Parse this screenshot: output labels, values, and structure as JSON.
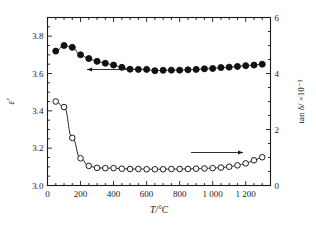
{
  "chart_data": {
    "type": "line",
    "title": "",
    "xlabel": "T/°C",
    "ylabel_left": "ε'",
    "ylabel_right": "tan δ/ ×10⁻³",
    "xlim": [
      0,
      1350
    ],
    "ylim_left": [
      3.0,
      3.9
    ],
    "ylim_right": [
      0,
      6
    ],
    "xticks": [
      0,
      200,
      400,
      600,
      800,
      1000,
      1200
    ],
    "xticklabels": [
      "0",
      "200",
      "400",
      "600",
      "800",
      "1 000",
      "1 200"
    ],
    "yticks_left": [
      3.0,
      3.2,
      3.4,
      3.6,
      3.8
    ],
    "yticklabels_left": [
      "3.0",
      "3.2",
      "3.4",
      "3.6",
      "3.8"
    ],
    "yticks_right": [
      0,
      2,
      4,
      6
    ],
    "yticklabels_right": [
      "0",
      "2",
      "4",
      "6"
    ],
    "xminor_step": 50,
    "yminor_left_step": 0.05,
    "yminor_right_step": 0.5,
    "grid": false,
    "legend": "none",
    "annotations": [
      {
        "name": "left-arrow",
        "text": "",
        "direction": "left",
        "points_to": "permittivity-series"
      },
      {
        "name": "right-arrow",
        "text": "",
        "direction": "right",
        "points_to": "loss-tangent-series"
      }
    ],
    "series": [
      {
        "name": "permittivity-series",
        "label": "ε'",
        "marker": "filled-circle",
        "axis": "left",
        "color": "#111111",
        "x": [
          50,
          100,
          150,
          200,
          250,
          300,
          350,
          400,
          450,
          500,
          550,
          600,
          650,
          700,
          750,
          800,
          850,
          900,
          950,
          1000,
          1050,
          1100,
          1150,
          1200,
          1250,
          1300
        ],
        "y": [
          3.72,
          3.75,
          3.74,
          3.7,
          3.68,
          3.665,
          3.655,
          3.645,
          3.633,
          3.623,
          3.622,
          3.622,
          3.615,
          3.617,
          3.618,
          3.618,
          3.62,
          3.622,
          3.625,
          3.627,
          3.632,
          3.634,
          3.638,
          3.642,
          3.645,
          3.65
        ]
      },
      {
        "name": "loss-tangent-series",
        "label": "tan δ",
        "marker": "open-circle",
        "axis": "right",
        "color": "#111111",
        "x": [
          50,
          100,
          150,
          200,
          250,
          300,
          350,
          400,
          450,
          500,
          550,
          600,
          650,
          700,
          750,
          800,
          850,
          900,
          950,
          1000,
          1050,
          1100,
          1150,
          1200,
          1250,
          1300
        ],
        "y_left_equiv": [
          3.45,
          3.42,
          3.255,
          3.145,
          3.105,
          3.095,
          3.093,
          3.093,
          3.09,
          3.088,
          3.088,
          3.087,
          3.087,
          3.087,
          3.088,
          3.088,
          3.089,
          3.09,
          3.091,
          3.093,
          3.096,
          3.1,
          3.108,
          3.118,
          3.135,
          3.152
        ],
        "y": [
          3.0,
          2.8,
          1.7,
          0.97,
          0.7,
          0.63,
          0.62,
          0.62,
          0.6,
          0.59,
          0.59,
          0.58,
          0.58,
          0.58,
          0.59,
          0.59,
          0.59,
          0.6,
          0.61,
          0.62,
          0.64,
          0.67,
          0.72,
          0.79,
          0.9,
          1.01
        ]
      }
    ]
  },
  "axes": {
    "left_label": "ε'",
    "right_label": "tan δ/ ×10⁻³",
    "bottom_label": "T/°C"
  },
  "colors": {
    "background": "#ffffff",
    "axis": "#1a1a1a",
    "marker_fill": "#111111",
    "marker_open": "#ffffff"
  }
}
